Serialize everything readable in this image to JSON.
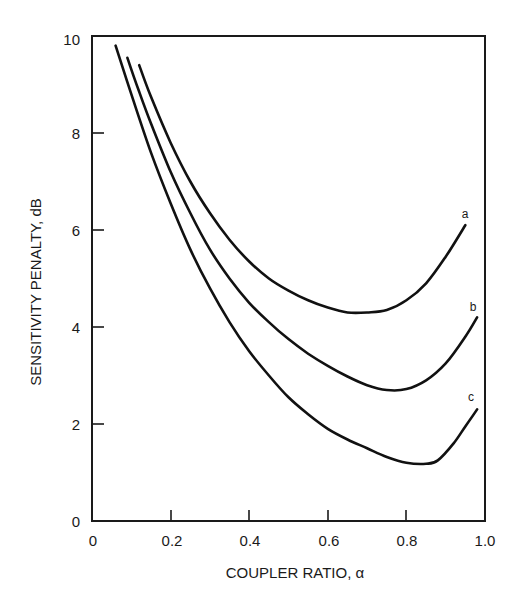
{
  "chart_data": {
    "type": "line",
    "title": "",
    "xlabel": "COUPLER RATIO, α",
    "ylabel": "SENSITIVITY PENALTY, dB",
    "xlim": [
      0,
      1.0
    ],
    "ylim": [
      0,
      10
    ],
    "x_ticks": [
      "0",
      "0.2",
      "0.4",
      "0.6",
      "0.8",
      "1.0"
    ],
    "y_ticks": [
      "0",
      "2",
      "4",
      "6",
      "8",
      "10"
    ],
    "grid": false,
    "legend": "inline labels at right end of curves",
    "series": [
      {
        "name": "a",
        "x": [
          0.12,
          0.15,
          0.2,
          0.25,
          0.3,
          0.35,
          0.4,
          0.45,
          0.5,
          0.55,
          0.6,
          0.65,
          0.7,
          0.75,
          0.8,
          0.85,
          0.9,
          0.95
        ],
        "y": [
          9.4,
          8.75,
          7.8,
          7.0,
          6.35,
          5.8,
          5.35,
          5.0,
          4.75,
          4.55,
          4.4,
          4.3,
          4.3,
          4.35,
          4.55,
          4.9,
          5.45,
          6.1
        ]
      },
      {
        "name": "b",
        "x": [
          0.09,
          0.12,
          0.15,
          0.2,
          0.25,
          0.3,
          0.35,
          0.4,
          0.45,
          0.5,
          0.55,
          0.6,
          0.65,
          0.7,
          0.75,
          0.8,
          0.85,
          0.9,
          0.95,
          0.98
        ],
        "y": [
          9.55,
          8.85,
          8.2,
          7.2,
          6.35,
          5.6,
          5.0,
          4.5,
          4.1,
          3.75,
          3.45,
          3.2,
          2.98,
          2.8,
          2.7,
          2.72,
          2.9,
          3.25,
          3.8,
          4.2
        ]
      },
      {
        "name": "c",
        "x": [
          0.06,
          0.1,
          0.15,
          0.2,
          0.25,
          0.3,
          0.35,
          0.4,
          0.45,
          0.5,
          0.55,
          0.6,
          0.65,
          0.7,
          0.75,
          0.8,
          0.85,
          0.88,
          0.92,
          0.95,
          0.98
        ],
        "y": [
          9.8,
          8.8,
          7.6,
          6.55,
          5.6,
          4.8,
          4.1,
          3.5,
          3.0,
          2.55,
          2.2,
          1.9,
          1.68,
          1.5,
          1.32,
          1.2,
          1.18,
          1.25,
          1.6,
          1.95,
          2.3
        ]
      }
    ]
  },
  "labels": {
    "xlabel": "COUPLER RATIO, α",
    "ylabel": "SENSITIVITY PENALTY, dB",
    "series_a": "a",
    "series_b": "b",
    "series_c": "c",
    "x0": "0",
    "x1": "0.2",
    "x2": "0.4",
    "x3": "0.6",
    "x4": "0.8",
    "x5": "1.0",
    "y0": "0",
    "y1": "2",
    "y2": "4",
    "y3": "6",
    "y4": "8",
    "y5": "10"
  }
}
